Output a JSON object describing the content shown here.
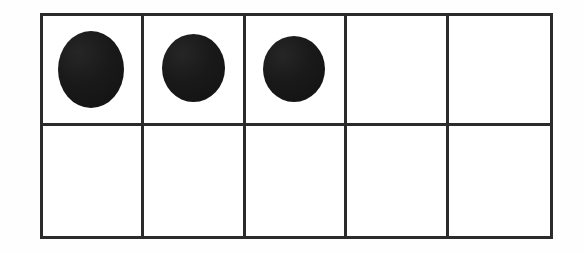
{
  "figure": {
    "type": "ten-frame",
    "rows": 2,
    "columns": 5,
    "total_cells": 10,
    "filled_count": 3,
    "empty_count": 7,
    "counter_shape": "circle",
    "counter_color": "#191919",
    "frame_line_color": "#2b2b2b",
    "background_color": "#ffffff"
  },
  "cells": [
    {
      "id": "cell-1",
      "row": 1,
      "column": 1,
      "filled": true,
      "label": "counter"
    },
    {
      "id": "cell-2",
      "row": 1,
      "column": 2,
      "filled": true,
      "label": "counter"
    },
    {
      "id": "cell-3",
      "row": 1,
      "column": 3,
      "filled": true,
      "label": "counter"
    },
    {
      "id": "cell-4",
      "row": 1,
      "column": 4,
      "filled": false,
      "label": ""
    },
    {
      "id": "cell-5",
      "row": 1,
      "column": 5,
      "filled": false,
      "label": ""
    },
    {
      "id": "cell-6",
      "row": 2,
      "column": 1,
      "filled": false,
      "label": ""
    },
    {
      "id": "cell-7",
      "row": 2,
      "column": 2,
      "filled": false,
      "label": ""
    },
    {
      "id": "cell-8",
      "row": 2,
      "column": 3,
      "filled": false,
      "label": ""
    },
    {
      "id": "cell-9",
      "row": 2,
      "column": 4,
      "filled": false,
      "label": ""
    },
    {
      "id": "cell-10",
      "row": 2,
      "column": 5,
      "filled": false,
      "label": ""
    }
  ]
}
